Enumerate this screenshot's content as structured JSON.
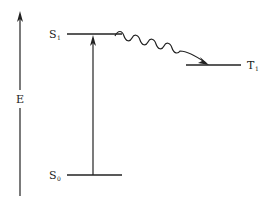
{
  "diagram": {
    "type": "jablonski-energy-level",
    "axis": {
      "label": "E",
      "direction": "up"
    },
    "levels": [
      {
        "id": "S1",
        "base": "S",
        "subscript": "1",
        "label_side": "left"
      },
      {
        "id": "S0",
        "base": "S",
        "subscript": "0",
        "label_side": "left"
      },
      {
        "id": "T1",
        "base": "T",
        "subscript": "1",
        "label_side": "right"
      }
    ],
    "transitions": [
      {
        "from": "S0",
        "to": "S1",
        "style": "straight-arrow",
        "meaning": "absorption"
      },
      {
        "from": "S1",
        "to": "T1",
        "style": "wavy-arrow",
        "meaning": "intersystem crossing"
      }
    ],
    "colors": {
      "stroke": "#222222",
      "background": "#ffffff"
    }
  }
}
